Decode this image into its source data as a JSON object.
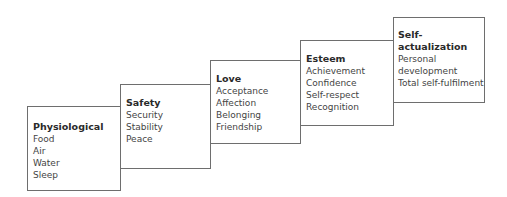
{
  "diagram": {
    "title": "",
    "levels": [
      {
        "title": "Physiological",
        "items": [
          "Food",
          "Air",
          "Water",
          "Sleep"
        ]
      },
      {
        "title": "Safety",
        "items": [
          "Security",
          "Stability",
          "Peace"
        ]
      },
      {
        "title": "Love",
        "items": [
          "Acceptance",
          "Affection",
          "Belonging",
          "Friendship"
        ]
      },
      {
        "title": "Esteem",
        "items": [
          "Achievement",
          "Confidence",
          "Self-respect",
          "Recognition"
        ]
      },
      {
        "title": "Self-actualization",
        "items": [
          "Personal",
          "development",
          "Total self-fulfilment"
        ]
      }
    ],
    "colors": {
      "border": "#6e6e6e",
      "text": "#3a3a3a",
      "background": "#ffffff"
    }
  }
}
